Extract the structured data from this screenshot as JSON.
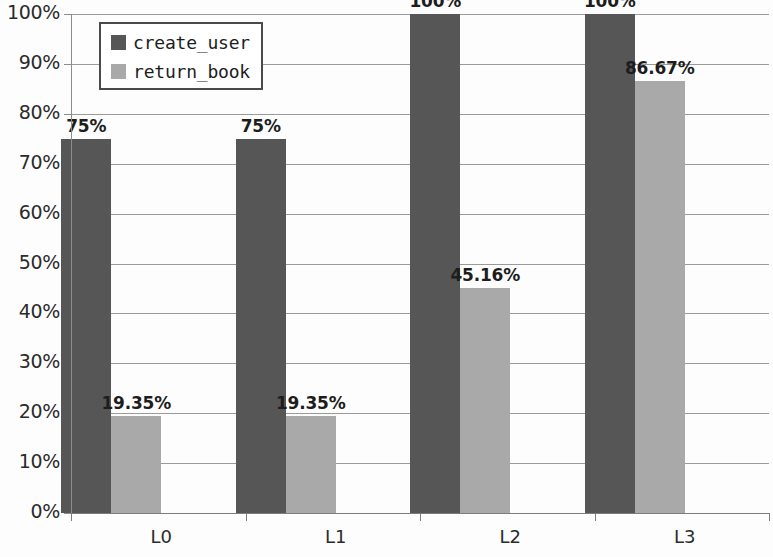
{
  "chart_data": {
    "type": "bar",
    "title": "",
    "subtitle": "",
    "xlabel": "",
    "ylabel": "",
    "categories": [
      "L0",
      "L1",
      "L2",
      "L3"
    ],
    "series": [
      {
        "name": "create_user",
        "color": "#565656",
        "values": [
          75,
          75,
          100,
          100
        ],
        "labels": [
          "75%",
          "75%",
          "100%",
          "100%"
        ]
      },
      {
        "name": "return_book",
        "color": "#a9a9a9",
        "values": [
          19.35,
          19.35,
          45.16,
          86.67
        ],
        "labels": [
          "19.35%",
          "19.35%",
          "45.16%",
          "86.67%"
        ]
      }
    ],
    "ylim": [
      0,
      100
    ],
    "ytick_values": [
      0,
      10,
      20,
      30,
      40,
      50,
      60,
      70,
      80,
      90,
      100
    ],
    "ytick_labels": [
      "0%",
      "10%",
      "20%",
      "30%",
      "40%",
      "50%",
      "60%",
      "70%",
      "80%",
      "90%",
      "100%"
    ],
    "grid": true,
    "grid_axis": "y",
    "legend_position": "top-left",
    "legend_entries": [
      "create_user",
      "return_book"
    ],
    "value_labels_shown": true,
    "bar_group_gap": true
  }
}
